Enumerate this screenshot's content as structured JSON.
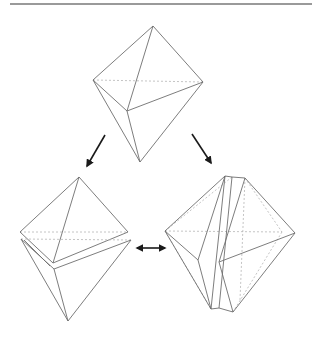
{
  "diagram": {
    "colors": {
      "edge": "#6e6e6e",
      "hidden_edge": "#b5b5b5",
      "arrow": "#1a1a1a",
      "rule": "#9a9a9a"
    },
    "figures": [
      {
        "id": "octahedron-whole",
        "position": "top-center"
      },
      {
        "id": "octahedron-split",
        "position": "bottom-left"
      },
      {
        "id": "octahedron-layered",
        "position": "bottom-right"
      }
    ],
    "arrows": [
      {
        "id": "arrow-to-split",
        "from": "octahedron-whole",
        "to": "octahedron-split",
        "type": "single"
      },
      {
        "id": "arrow-to-layered",
        "from": "octahedron-whole",
        "to": "octahedron-layered",
        "type": "single"
      },
      {
        "id": "arrow-between",
        "from": "octahedron-split",
        "to": "octahedron-layered",
        "type": "double"
      }
    ]
  }
}
